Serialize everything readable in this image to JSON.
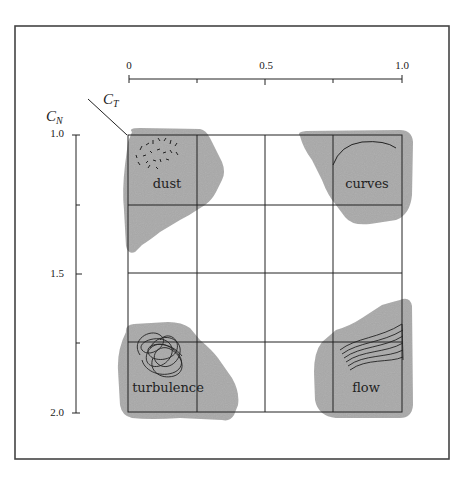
{
  "figure": {
    "x_axis": {
      "ticks": [
        "0",
        "0.5",
        "1.0"
      ],
      "label": "C_T",
      "label_main": "C",
      "label_sub": "T",
      "range": [
        0,
        1.0
      ],
      "minor_ticks": [
        0.25,
        0.75
      ]
    },
    "y_axis": {
      "ticks": [
        "1.0",
        "1.5",
        "2.0"
      ],
      "label": "C_N",
      "label_main": "C",
      "label_sub": "N",
      "range": [
        1.0,
        2.0
      ],
      "minor_ticks": [
        1.25,
        1.75
      ]
    },
    "grid": {
      "rows": 4,
      "cols": 4
    },
    "regions": [
      {
        "name": "dust",
        "label": "dust",
        "position": "top-left",
        "glyph": "scattered dashes"
      },
      {
        "name": "curves",
        "label": "curves",
        "position": "top-right",
        "glyph": "single arc"
      },
      {
        "name": "turbulence",
        "label": "turbulence",
        "position": "bottom-left",
        "glyph": "tangled loops"
      },
      {
        "name": "flow",
        "label": "flow",
        "position": "bottom-right",
        "glyph": "parallel streamlines"
      }
    ],
    "colors": {
      "region_fill": "#a9a9a9",
      "line": "#222222",
      "frame": "#444444",
      "background": "#ffffff"
    }
  }
}
